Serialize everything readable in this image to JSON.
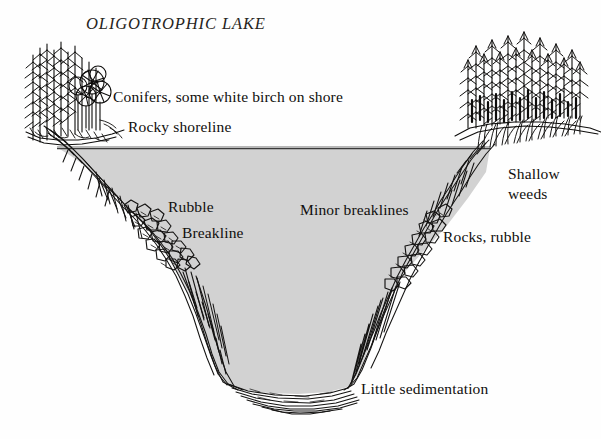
{
  "diagram": {
    "title": "OLIGOTROPHIC LAKE",
    "background_color": "#fefefe",
    "water_fill_color": "#d2d2d2",
    "ink_color": "#100f0d",
    "waterline_color": "#3a3a3a"
  },
  "labels": {
    "title": "OLIGOTROPHIC LAKE",
    "conifers": "Conifers, some white birch on shore",
    "rocky_shoreline": "Rocky shoreline",
    "rubble": "Rubble",
    "breakline": "Breakline",
    "minor_breaklines": "Minor breaklines",
    "shallow_weeds": "Shallow\nweeds",
    "rocks_rubble": "Rocks, rubble",
    "little_sedimentation": "Little sedimentation"
  },
  "features": {
    "left_shore": "steep rocky shoreline with conifer and birch trees",
    "right_shore": "dense conifer forest above shallow weed bed",
    "basin": "deep steep-sided V-shaped basin filled with water",
    "bottom": "flat narrow bottom with little sedimentation"
  }
}
